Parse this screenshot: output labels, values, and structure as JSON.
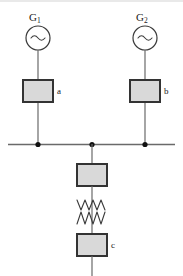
{
  "diagram": {
    "type": "one-line-electrical-schematic",
    "colors": {
      "line": "#4d4d4d",
      "box_fill": "#d9d9d9",
      "box_stroke": "#333333",
      "node_dot": "#111111",
      "background": "#ffffff",
      "text": "#1a1a1a"
    },
    "generators": [
      {
        "id": "g1",
        "label": "G",
        "subscript": "1",
        "symbol": "sine-wave",
        "cx": 38,
        "cy": 38,
        "r": 12
      },
      {
        "id": "g2",
        "label": "G",
        "subscript": "2",
        "symbol": "sine-wave",
        "cx": 145,
        "cy": 38,
        "r": 12
      }
    ],
    "boxes": [
      {
        "id": "box-a",
        "label": "a",
        "x": 23,
        "y": 80,
        "w": 30,
        "h": 22
      },
      {
        "id": "box-b",
        "label": "b",
        "x": 130,
        "y": 80,
        "w": 30,
        "h": 22
      },
      {
        "id": "box-mid",
        "label": "",
        "x": 77,
        "y": 164,
        "w": 30,
        "h": 22
      },
      {
        "id": "box-c",
        "label": "c",
        "x": 77,
        "y": 234,
        "w": 30,
        "h": 22
      }
    ],
    "bus": {
      "id": "bus-bar",
      "y": 144,
      "x_start": 8,
      "x_end": 175,
      "nodes": [
        {
          "id": "node-left",
          "x": 38
        },
        {
          "id": "node-mid",
          "x": 92
        },
        {
          "id": "node-right",
          "x": 145
        }
      ]
    },
    "reactance": {
      "id": "zigzag-reactance",
      "symbol": "double-zigzag",
      "x_center": 92,
      "y_top": 198,
      "y_bottom": 226,
      "rows": 2,
      "peaks": 3,
      "half_width": 15
    },
    "feeder": {
      "id": "outgoing-feeder",
      "x": 92,
      "y_start": 256,
      "y_end": 276
    }
  }
}
